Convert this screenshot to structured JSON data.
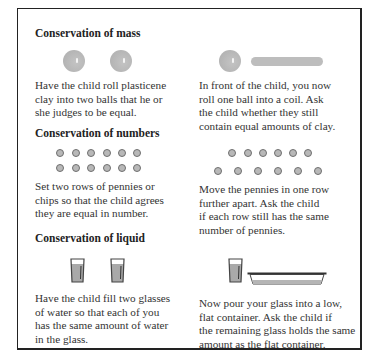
{
  "sections": [
    {
      "title": "Conservation of mass",
      "left_text": [
        "Have the child roll plasticene",
        "clay into two balls that he or",
        "she judges to be equal."
      ],
      "right_text": [
        "In front of the child, you now",
        "roll one ball into a coil.  Ask",
        "the child whether they still",
        "contain equal amounts of clay."
      ]
    },
    {
      "title": "Conservation of numbers",
      "left_text": [
        "Set two rows of pennies or",
        "chips so that the child agrees",
        "they are equal in number."
      ],
      "right_text": [
        "Move the pennies in one row",
        "further apart.  Ask the child",
        "if each row still has the same",
        "number of pennies."
      ]
    },
    {
      "title": "Conservation of liquid",
      "left_text": [
        "Have the child fill two glasses",
        "of water so that each of you",
        "has the same amount of water",
        "in the glass."
      ],
      "right_text": [
        "Now pour your glass into a low,",
        "flat container.  Ask the child if",
        "the remaining glass holds the same",
        "amount as the flat container."
      ]
    }
  ],
  "illustrations": {
    "mass_left": "two-clay-balls",
    "mass_right": "ball-and-coil",
    "numbers_left": "two-equal-rows-of-six-pennies",
    "numbers_right": "one-row-spread-apart",
    "liquid_left": "two-glasses-of-water",
    "liquid_right": "glass-and-flat-container"
  },
  "colors": {
    "frame": "#222222",
    "clay": "#bdbdbd",
    "coin": "#b8b8b8",
    "water": "#a8a8a8"
  }
}
